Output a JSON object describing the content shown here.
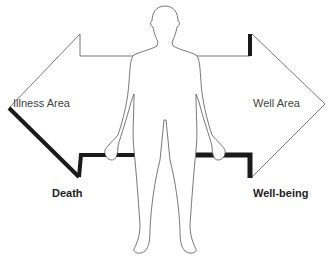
{
  "diagram": {
    "type": "illness-wellness continuum",
    "left_arrow": {
      "label": "Illness Area",
      "endpoint_label": "Death"
    },
    "right_arrow": {
      "label": "Well Area",
      "endpoint_label": "Well-being"
    },
    "center_figure": "human-body-outline",
    "colors": {
      "line": "#555555",
      "heavy": "#1a1a1a",
      "background": "#ffffff"
    }
  }
}
